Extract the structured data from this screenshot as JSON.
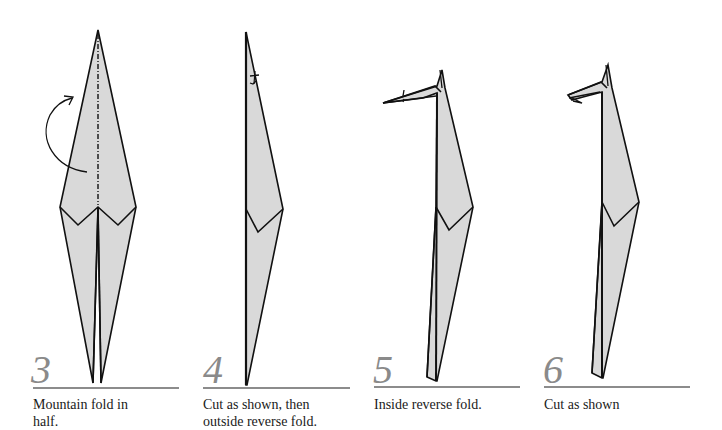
{
  "colors": {
    "paper_fill": "#d9d9d9",
    "line": "#111111",
    "step_number": "#8a8a8a",
    "rule": "#8c8c8c",
    "background": "#ffffff"
  },
  "steps": [
    {
      "number": "3",
      "caption_line1": "Mountain fold in",
      "caption_line2": "half."
    },
    {
      "number": "4",
      "caption_line1": "Cut as shown, then",
      "caption_line2": "outside reverse fold."
    },
    {
      "number": "5",
      "caption_line1": "Inside reverse fold.",
      "caption_line2": ""
    },
    {
      "number": "6",
      "caption_line1": "Cut as shown",
      "caption_line2": ""
    }
  ]
}
